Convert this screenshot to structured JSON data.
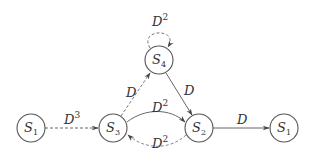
{
  "diagram": {
    "type": "state-transition-graph",
    "nodes": [
      {
        "id": "s1_left",
        "label": "S",
        "sub": "1",
        "cx": 31,
        "cy": 128
      },
      {
        "id": "s3",
        "label": "S",
        "sub": "3",
        "cx": 113,
        "cy": 128
      },
      {
        "id": "s2",
        "label": "S",
        "sub": "2",
        "cx": 199,
        "cy": 128
      },
      {
        "id": "s1_right",
        "label": "S",
        "sub": "1",
        "cx": 284,
        "cy": 128
      },
      {
        "id": "s4",
        "label": "S",
        "sub": "4",
        "cx": 159,
        "cy": 60
      }
    ],
    "edges": [
      {
        "id": "s1_to_s3",
        "from": "s1_left",
        "to": "s3",
        "style": "dashed",
        "label": "D",
        "sup": "3"
      },
      {
        "id": "s3_to_s4",
        "from": "s3",
        "to": "s4",
        "style": "dashed",
        "label": "D",
        "sup": ""
      },
      {
        "id": "s4_self",
        "from": "s4",
        "to": "s4",
        "style": "dashed",
        "label": "D",
        "sup": "2"
      },
      {
        "id": "s4_to_s2",
        "from": "s4",
        "to": "s2",
        "style": "solid",
        "label": "D",
        "sup": ""
      },
      {
        "id": "s3_to_s2",
        "from": "s3",
        "to": "s2",
        "style": "solid",
        "label": "D",
        "sup": "2"
      },
      {
        "id": "s2_to_s3",
        "from": "s2",
        "to": "s3",
        "style": "dashed",
        "label": "D",
        "sup": "2"
      },
      {
        "id": "s2_to_s1",
        "from": "s2",
        "to": "s1_right",
        "style": "solid",
        "label": "D",
        "sup": ""
      }
    ]
  },
  "colors": {
    "stroke": "#555555",
    "text": "#333333",
    "background": "#ffffff"
  }
}
